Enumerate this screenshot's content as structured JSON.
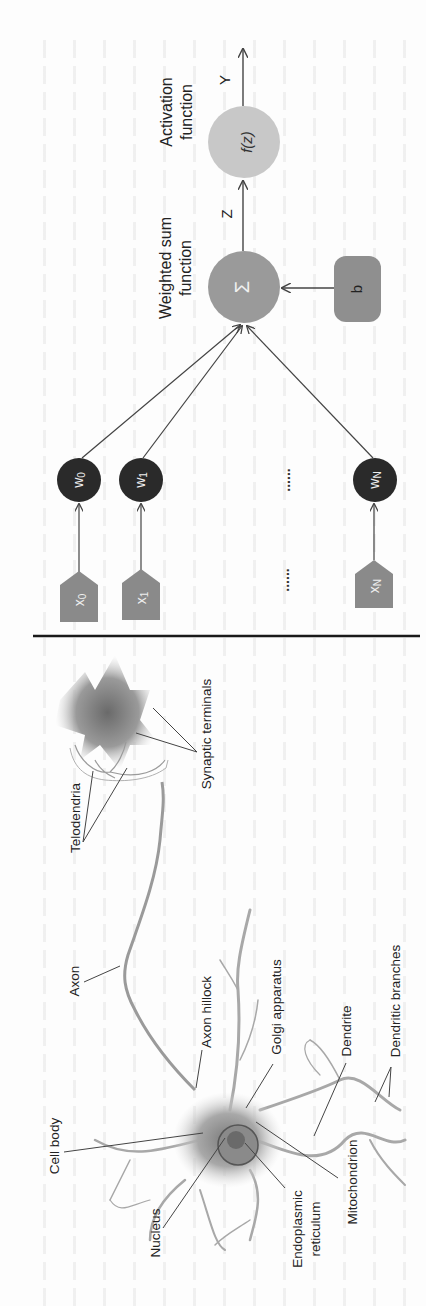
{
  "figure": {
    "orientation": "rotated-90-ccw",
    "artificial_neuron": {
      "inputs": [
        {
          "label": "x",
          "sub": "0"
        },
        {
          "label": "x",
          "sub": "1"
        },
        {
          "label": "x",
          "sub": "N"
        }
      ],
      "weights": [
        {
          "label": "w",
          "sub": "0"
        },
        {
          "label": "w",
          "sub": "1"
        },
        {
          "label": "w",
          "sub": "N"
        }
      ],
      "ellipsis": "......",
      "weighted_sum": {
        "label_line1": "Weighted sum",
        "label_line2": "function",
        "symbol": "Σ"
      },
      "bias": {
        "label": "b"
      },
      "intermediate": {
        "label": "Z"
      },
      "activation": {
        "label_line1": "Activation",
        "label_line2": "function",
        "symbol": "f(z)"
      },
      "output": {
        "label": "Y"
      }
    },
    "biological_neuron": {
      "labels": {
        "synaptic_terminals": "Synaptic terminals",
        "telodendria": "Telodendria",
        "axon": "Axon",
        "axon_hillock": "Axon hillock",
        "golgi_apparatus": "Golgi apparatus",
        "dendrite": "Dendrite",
        "dendritic_branches": "Dendritic branches",
        "cell_body": "Cell body",
        "nucleus": "Nucleus",
        "endoplasmic_reticulum_1": "Endoplasmic",
        "endoplasmic_reticulum_2": "reticulum",
        "mitochondrion": "Mitochondrion"
      }
    },
    "colors": {
      "weight_node": "#2a2a2a",
      "input_node": "#8a8a8a",
      "sum_node": "#9a9a9a",
      "activation_node": "#c8c8c8",
      "bias_node": "#8f8f8f",
      "line": "#444444",
      "divider": "#1a1a1a"
    }
  }
}
